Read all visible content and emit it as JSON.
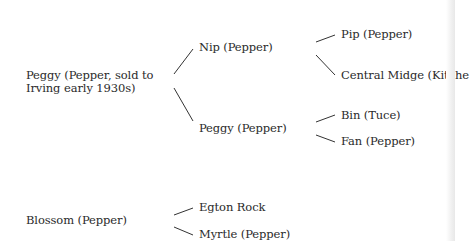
{
  "diagram": {
    "type": "family-tree",
    "roots": [
      {
        "label": "Peggy (Pepper, sold to Irving early 1930s)",
        "children": [
          {
            "label": "Nip (Pepper)",
            "children": [
              {
                "label": "Pip (Pepper)"
              },
              {
                "label": "Central Midge (Kitche"
              }
            ]
          },
          {
            "label": "Peggy (Pepper)",
            "children": [
              {
                "label": "Bin (Tuce)"
              },
              {
                "label": "Fan (Pepper)"
              }
            ]
          }
        ]
      },
      {
        "label": "Blossom (Pepper)",
        "children": [
          {
            "label": "Egton Rock"
          },
          {
            "label": "Myrtle (Pepper)"
          }
        ]
      }
    ]
  },
  "nodes": {
    "peggy_root": "Peggy (Pepper, sold to Irving early 1930s)",
    "nip": "Nip (Pepper)",
    "peggy_child": "Peggy (Pepper)",
    "pip": "Pip (Pepper)",
    "central_midge": "Central Midge (Kitche",
    "bin": "Bin (Tuce)",
    "fan": "Fan (Pepper)",
    "blossom": "Blossom (Pepper)",
    "egton_rock": "Egton Rock",
    "myrtle": "Myrtle (Pepper)"
  },
  "colors": {
    "background": "#ffffff",
    "text": "#2a2a2a",
    "lines": "#333333"
  }
}
